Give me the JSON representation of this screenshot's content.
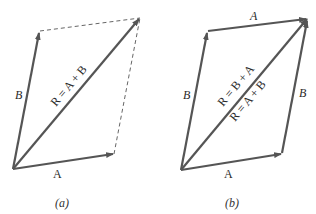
{
  "figures": [
    {
      "caption": "(a)",
      "labels": {
        "A": "A",
        "B": "B",
        "R": "R = A + B"
      }
    },
    {
      "caption": "(b)",
      "labels": {
        "A_bottom": "A",
        "A_top": "A",
        "B_left": "B",
        "B_right": "B",
        "R1": "R = B + A",
        "R2": "R = A + B"
      }
    }
  ],
  "colors": {
    "vector": "#555555",
    "dashed": "#666666",
    "text": "#2a2a2a"
  }
}
